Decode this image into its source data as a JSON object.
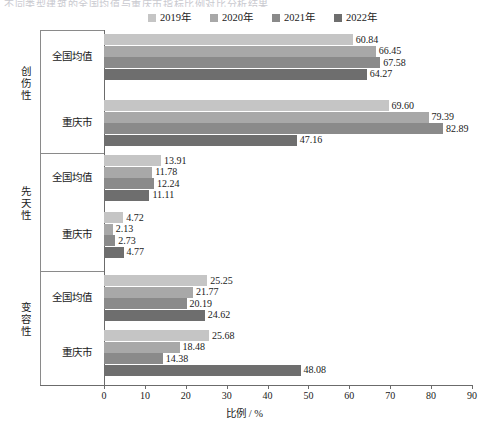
{
  "title_fragment": "不同类型建筑的全国均值与重庆市指标比例对比分析结果",
  "legend": {
    "position": "top-center",
    "items": [
      {
        "label": "2019年",
        "color": "#c5c5c5"
      },
      {
        "label": "2020年",
        "color": "#a8a8a8"
      },
      {
        "label": "2021年",
        "color": "#8a8a8a"
      },
      {
        "label": "2022年",
        "color": "#6e6e6e"
      }
    ]
  },
  "axis": {
    "xlabel": "比例 / %",
    "xticks": [
      0,
      10,
      20,
      30,
      40,
      50,
      60,
      70,
      80,
      90
    ],
    "xlim": [
      0,
      90
    ]
  },
  "groups": [
    {
      "name": "创伤性",
      "rows": [
        "全国均值",
        "重庆市"
      ]
    },
    {
      "name": "先天性",
      "rows": [
        "全国均值",
        "重庆市"
      ]
    },
    {
      "name": "变容性",
      "rows": [
        "全国均值",
        "重庆市"
      ]
    }
  ],
  "chart_data": {
    "type": "bar",
    "orientation": "horizontal",
    "title": "",
    "xlabel": "比例 / %",
    "ylabel": "",
    "xlim": [
      0,
      90
    ],
    "grid": false,
    "legend_position": "top",
    "categories": [
      "创伤性 / 全国均值",
      "创伤性 / 重庆市",
      "先天性 / 全国均值",
      "先天性 / 重庆市",
      "变容性 / 全国均值",
      "变容性 / 重庆市"
    ],
    "series": [
      {
        "name": "2019年",
        "color": "#c5c5c5",
        "values": [
          60.84,
          69.6,
          13.91,
          4.72,
          25.25,
          25.68
        ]
      },
      {
        "name": "2020年",
        "color": "#a8a8a8",
        "values": [
          66.45,
          79.39,
          11.78,
          2.13,
          21.77,
          18.48
        ]
      },
      {
        "name": "2021年",
        "color": "#8a8a8a",
        "values": [
          67.58,
          82.89,
          12.24,
          2.73,
          20.19,
          14.38
        ]
      },
      {
        "name": "2022年",
        "color": "#6e6e6e",
        "values": [
          64.27,
          47.16,
          11.11,
          4.77,
          24.62,
          48.08
        ]
      }
    ],
    "data_labels": [
      [
        "60.84",
        "66.45",
        "67.58",
        "64.27"
      ],
      [
        "69.60",
        "79.39",
        "82.89",
        "47.16"
      ],
      [
        "13.91",
        "11.78",
        "12.24",
        "11.11"
      ],
      [
        "4.72",
        "2.13",
        "2.73",
        "4.77"
      ],
      [
        "25.25",
        "21.77",
        "20.19",
        "24.62"
      ],
      [
        "25.68",
        "18.48",
        "14.38",
        "48.08"
      ]
    ]
  }
}
